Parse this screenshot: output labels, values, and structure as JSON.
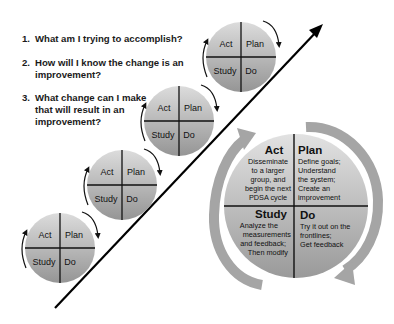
{
  "questions": [
    {
      "number": "1.",
      "lines": [
        "What am I trying to accomplish?"
      ]
    },
    {
      "number": "2.",
      "lines": [
        "How will I know the change is an",
        "improvement?"
      ]
    },
    {
      "number": "3.",
      "lines": [
        "What change can I make",
        "that will result in an",
        "improvement?"
      ]
    }
  ],
  "small_cycle": {
    "act": "Act",
    "plan": "Plan",
    "study": "Study",
    "do": "Do"
  },
  "big_cycle": {
    "act": {
      "title": "Act",
      "lines": [
        "Disseminate",
        "to a larger",
        "group, and",
        "begin the next",
        "PDSA cycle"
      ]
    },
    "plan": {
      "title": "Plan",
      "lines": [
        "Define goals;",
        "Understand",
        "the system;",
        "Create an",
        "improvement"
      ]
    },
    "study": {
      "title": "Study",
      "lines": [
        "Analyze the",
        "measurements",
        "and feedback;",
        "Then modify"
      ]
    },
    "do": {
      "title": "Do",
      "lines": [
        "Try it out on the",
        "frontlines;",
        "Get feedback"
      ]
    }
  },
  "colors": {
    "circle_top": "#d6d6d6",
    "circle_bottom": "#9c9c9c",
    "divider": "#111111",
    "arrow_gray": "#a8a8a8",
    "ramp_line": "#000000"
  }
}
